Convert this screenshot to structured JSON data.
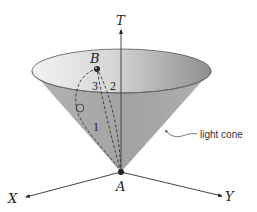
{
  "diagram": {
    "axes": {
      "t_label": "T",
      "x_label": "X",
      "y_label": "Y"
    },
    "points": {
      "a_label": "A",
      "b_label": "B"
    },
    "paths": [
      {
        "id": "path-1",
        "label": "1",
        "style": "solid-dashed curve with small loop"
      },
      {
        "id": "path-2",
        "label": "2",
        "style": "dashed"
      },
      {
        "id": "path-3",
        "label": "3",
        "style": "dashed"
      }
    ],
    "annotation": {
      "light_cone_label": "light cone"
    },
    "colors": {
      "cone_outer": "#a8a8a8",
      "cone_outer_dark": "#9a9a9a",
      "cone_inner_light": "#ececec",
      "cone_inner_dark": "#9c9c9c",
      "line": "#333333"
    }
  }
}
